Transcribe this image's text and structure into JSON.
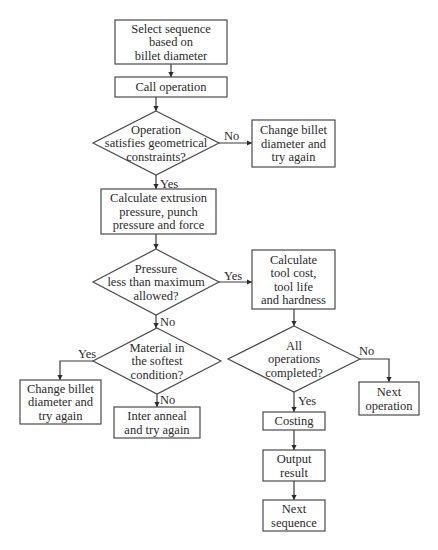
{
  "diagram": {
    "type": "flowchart",
    "nodes": {
      "select_sequence": {
        "kind": "process",
        "lines": [
          "Select sequence",
          "based on",
          "billet diameter"
        ]
      },
      "call_operation": {
        "kind": "process",
        "lines": [
          "Call operation"
        ]
      },
      "geom_check": {
        "kind": "decision",
        "lines": [
          "Operation",
          "satisfies geometrical",
          "constraints?"
        ]
      },
      "change_billet_1": {
        "kind": "process",
        "lines": [
          "Change billet",
          "diameter and",
          "try again"
        ]
      },
      "calc_pressure": {
        "kind": "process",
        "lines": [
          "Calculate extrusion",
          "pressure, punch",
          "pressure and force"
        ]
      },
      "pressure_check": {
        "kind": "decision",
        "lines": [
          "Pressure",
          "less than maximum",
          "allowed?"
        ]
      },
      "calc_tool": {
        "kind": "process",
        "lines": [
          "Calculate",
          "tool cost,",
          "tool life",
          "and hardness"
        ]
      },
      "material_check": {
        "kind": "decision",
        "lines": [
          "Material in",
          "the softest",
          "condition?"
        ]
      },
      "change_billet_2": {
        "kind": "process",
        "lines": [
          "Change billet",
          "diameter and",
          "try again"
        ]
      },
      "inter_anneal": {
        "kind": "process",
        "lines": [
          "Inter anneal",
          "and try again"
        ]
      },
      "all_ops_check": {
        "kind": "decision",
        "lines": [
          "All",
          "operations",
          "completed?"
        ]
      },
      "next_operation": {
        "kind": "process",
        "lines": [
          "Next",
          "operation"
        ]
      },
      "costing": {
        "kind": "process",
        "lines": [
          "Costing"
        ]
      },
      "output_result": {
        "kind": "process",
        "lines": [
          "Output",
          "result"
        ]
      },
      "next_sequence": {
        "kind": "process",
        "lines": [
          "Next",
          "sequence"
        ]
      }
    },
    "edges": [
      {
        "from": "select_sequence",
        "to": "call_operation",
        "label": ""
      },
      {
        "from": "call_operation",
        "to": "geom_check",
        "label": ""
      },
      {
        "from": "geom_check",
        "to": "change_billet_1",
        "label": "No"
      },
      {
        "from": "geom_check",
        "to": "calc_pressure",
        "label": "Yes"
      },
      {
        "from": "calc_pressure",
        "to": "pressure_check",
        "label": ""
      },
      {
        "from": "pressure_check",
        "to": "calc_tool",
        "label": "Yes"
      },
      {
        "from": "pressure_check",
        "to": "material_check",
        "label": "No"
      },
      {
        "from": "material_check",
        "to": "change_billet_2",
        "label": "Yes"
      },
      {
        "from": "material_check",
        "to": "inter_anneal",
        "label": "No"
      },
      {
        "from": "calc_tool",
        "to": "all_ops_check",
        "label": ""
      },
      {
        "from": "all_ops_check",
        "to": "next_operation",
        "label": "No"
      },
      {
        "from": "all_ops_check",
        "to": "costing",
        "label": "Yes"
      },
      {
        "from": "costing",
        "to": "output_result",
        "label": ""
      },
      {
        "from": "output_result",
        "to": "next_sequence",
        "label": ""
      }
    ],
    "labels": {
      "geom_no": "No",
      "geom_yes": "Yes",
      "pressure_yes": "Yes",
      "pressure_no": "No",
      "material_yes": "Yes",
      "material_no": "No",
      "allops_no": "No",
      "allops_yes": "Yes"
    }
  }
}
